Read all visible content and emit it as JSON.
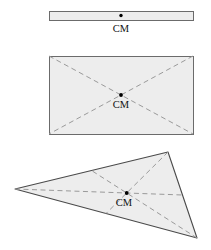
{
  "figure": {
    "background_color": "#ffffff",
    "shape_fill_color": "#ededed",
    "shape_outline_color": "#6b6b6b",
    "triangle_outline_color": "#4a4a4a",
    "dashed_line_color": "#9a9a9a",
    "marker_color": "#000000",
    "label_color": "#111111",
    "canvas": {
      "width": 211,
      "height": 250
    }
  },
  "shapes": [
    {
      "id": "thin-bar",
      "name": "thin uniform bar",
      "kind": "rectangle",
      "x": 49,
      "y": 11,
      "width": 144,
      "height": 9,
      "has_dashed_diagonals": false,
      "cm_marker": {
        "x": 121,
        "y": 15.5,
        "radius": 1.7
      },
      "cm_label": {
        "text": "CM",
        "x": 121,
        "y": 32
      }
    },
    {
      "id": "rectangle",
      "name": "uniform rectangular plate",
      "kind": "rectangle",
      "x": 49,
      "y": 56,
      "width": 144,
      "height": 78,
      "has_dashed_diagonals": true,
      "diagonals": [
        {
          "x1": 49,
          "y1": 56,
          "x2": 193,
          "y2": 134
        },
        {
          "x1": 193,
          "y1": 56,
          "x2": 49,
          "y2": 134
        }
      ],
      "cm_marker": {
        "x": 121,
        "y": 95,
        "radius": 1.9
      },
      "cm_label": {
        "text": "CM",
        "x": 121,
        "y": 108
      }
    },
    {
      "id": "triangle",
      "name": "uniform triangular plate",
      "kind": "triangle",
      "vertices": [
        {
          "label": "left-vertex",
          "x": 15,
          "y": 189
        },
        {
          "label": "top-right-vertex",
          "x": 168,
          "y": 152
        },
        {
          "label": "bottom-right-vertex",
          "x": 197,
          "y": 238
        }
      ],
      "has_dashed_medians": true,
      "medians": [
        {
          "from": "left-vertex",
          "x1": 15,
          "y1": 189,
          "x2": 182.5,
          "y2": 195
        },
        {
          "from": "top-right-vertex",
          "x1": 168,
          "y1": 152,
          "x2": 106,
          "y2": 213.5
        },
        {
          "from": "bottom-right-vertex",
          "x1": 197,
          "y1": 238,
          "x2": 91.5,
          "y2": 170.5
        }
      ],
      "cm_marker": {
        "x": 126.7,
        "y": 193,
        "radius": 1.9
      },
      "cm_label": {
        "text": "CM",
        "x": 124,
        "y": 206
      }
    }
  ]
}
